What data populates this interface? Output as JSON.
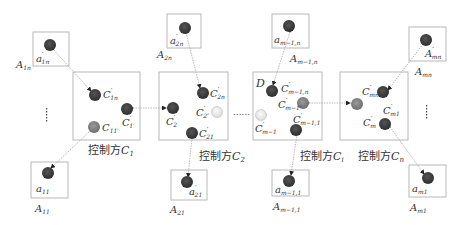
{
  "diagram": {
    "type": "multi-party control network",
    "colors": {
      "box_stroke": "#b8b8b8",
      "node_dark": "#3b3b3b",
      "node_grey": "#7a7a7a",
      "node_light": "#e6e6e6",
      "edge": "#aaaaaa",
      "text": "#333333"
    },
    "controllers": [
      {
        "id": "C1",
        "label": "控制方",
        "sub": "C",
        "idx": "1",
        "nodes": [
          {
            "label": "C",
            "sup": "′",
            "sub": "1n"
          },
          {
            "label": "C",
            "sub": "11′"
          },
          {
            "label": "C",
            "sup": "′",
            "sub": "1′"
          }
        ]
      },
      {
        "id": "C2",
        "label": "控制方",
        "sub": "C",
        "idx": "2",
        "nodes": [
          {
            "label": "C",
            "sup": "′",
            "sub": "2n"
          },
          {
            "label": "C",
            "sup": "′",
            "sub": "2"
          },
          {
            "label": "C",
            "sup": "′",
            "sub": "2″"
          },
          {
            "label": "C",
            "sup": "′",
            "sub": "21"
          }
        ]
      },
      {
        "id": "Ci",
        "label": "控制方",
        "sub": "C",
        "idx": "i",
        "marker": "D",
        "nodes": [
          {
            "label": "C",
            "sup": "′",
            "sub": "m−1,n"
          },
          {
            "label": "C",
            "sup": "′",
            "sub": "m−1″"
          },
          {
            "label": "C",
            "sup": "′",
            "sub": "m−1"
          },
          {
            "label": "C",
            "sup": "′",
            "sub": "m−1,1"
          }
        ]
      },
      {
        "id": "Cn",
        "label": "控制方",
        "sub": "C",
        "idx": "n",
        "nodes": [
          {
            "label": "C",
            "sup": "′",
            "sub": "mn"
          },
          {
            "label": "C",
            "sup": "′",
            "sub": "m"
          },
          {
            "label": "C",
            "sup": "′",
            "sub": "m1"
          }
        ]
      }
    ],
    "agents": [
      {
        "id": "A1n",
        "box_label": "A",
        "box_sub": "1n",
        "node": "a",
        "node_sup": "′",
        "node_sub": "1n"
      },
      {
        "id": "A11",
        "box_label": "A",
        "box_sub": "11",
        "node": "a",
        "node_sub": "11"
      },
      {
        "id": "A2n",
        "box_label": "A",
        "box_sub": "2n",
        "node": "a",
        "node_sup": "′",
        "node_sub": "2n"
      },
      {
        "id": "A21",
        "box_label": "A",
        "box_sub": "21",
        "node": "a",
        "node_sup": "′",
        "node_sub": "21"
      },
      {
        "id": "Am-1n",
        "box_label": "A",
        "box_sub": "m−1,n",
        "node": "a",
        "node_sub": "m−1,n"
      },
      {
        "id": "Am-11",
        "box_label": "A",
        "box_sub": "m−1,1",
        "node": "a",
        "node_sub": "m−1,1"
      },
      {
        "id": "Amn",
        "box_label": "A",
        "box_sub": "mn",
        "node": "A",
        "node_sup": "′",
        "node_sub": "mn"
      },
      {
        "id": "Am1",
        "box_label": "A",
        "box_sub": "m1",
        "node": "a",
        "node_sub": "m1"
      }
    ],
    "ellipsis_between": "......",
    "vertical_ellipsis": "⋮"
  }
}
